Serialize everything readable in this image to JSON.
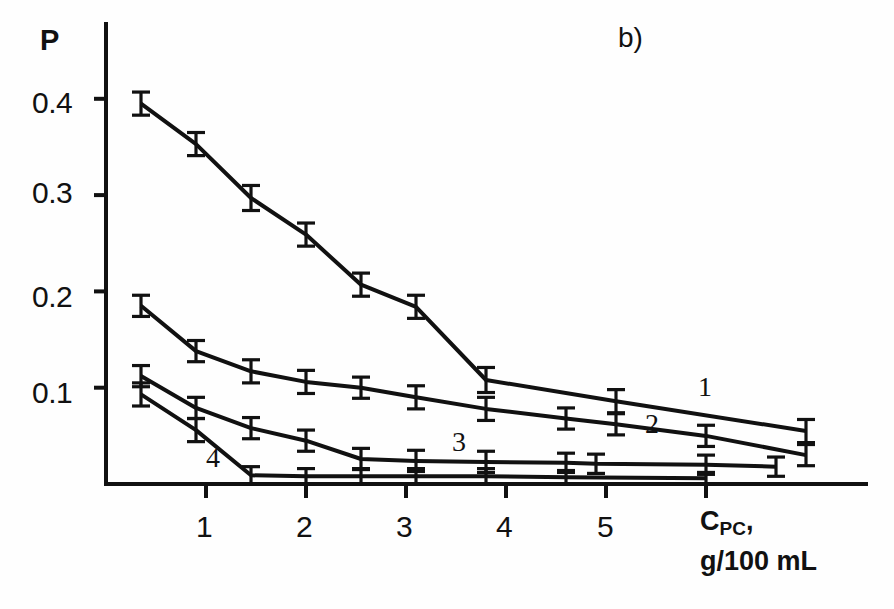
{
  "figure": {
    "panel_label": "b)",
    "background_color": "#fefefe",
    "ink_color": "#111111"
  },
  "axes": {
    "y_title": "P",
    "x_title_main": "C",
    "x_title_sub": "PC",
    "x_title_comma": ",",
    "x_units": "g/100 mL",
    "y_ticks": [
      "0.1",
      "0.2",
      "0.3",
      "0.4"
    ],
    "x_ticks": [
      "1",
      "2",
      "3",
      "4",
      "5"
    ]
  },
  "curve_labels": {
    "one": "1",
    "two": "2",
    "three": "3",
    "four": "4"
  },
  "chart_data": {
    "type": "line",
    "title": "b)",
    "xlabel": "C_PC, g/100 mL",
    "ylabel": "P",
    "xlim": [
      0,
      7.6
    ],
    "ylim": [
      0,
      0.47
    ],
    "grid": false,
    "legend": "inline curve numbers 1-4",
    "error_bars": "symmetric vertical I-bars on every point",
    "series": [
      {
        "name": "1",
        "label_position": {
          "x": 6.1,
          "y": 0.105
        },
        "x": [
          0.35,
          0.9,
          1.45,
          2.0,
          2.55,
          3.1,
          3.8,
          5.1,
          7.0
        ],
        "y": [
          0.395,
          0.353,
          0.297,
          0.259,
          0.207,
          0.184,
          0.108,
          0.086,
          0.055
        ],
        "yerr": [
          0.012,
          0.012,
          0.013,
          0.012,
          0.012,
          0.012,
          0.013,
          0.012,
          0.012
        ]
      },
      {
        "name": "2",
        "label_position": {
          "x": 5.45,
          "y": 0.073
        },
        "x": [
          0.35,
          0.9,
          1.45,
          2.0,
          2.55,
          3.1,
          3.8,
          4.6,
          5.1,
          6.0,
          7.0
        ],
        "y": [
          0.185,
          0.138,
          0.117,
          0.106,
          0.1,
          0.09,
          0.078,
          0.068,
          0.062,
          0.05,
          0.03
        ],
        "yerr": [
          0.011,
          0.011,
          0.012,
          0.012,
          0.011,
          0.012,
          0.012,
          0.011,
          0.011,
          0.011,
          0.011
        ]
      },
      {
        "name": "3",
        "label_position": {
          "x": 3.55,
          "y": 0.042
        },
        "x": [
          0.35,
          0.9,
          1.45,
          2.0,
          2.55,
          3.1,
          3.8,
          4.6,
          4.9,
          6.0,
          6.7
        ],
        "y": [
          0.112,
          0.079,
          0.058,
          0.045,
          0.026,
          0.024,
          0.023,
          0.022,
          0.021,
          0.02,
          0.018
        ],
        "yerr": [
          0.011,
          0.011,
          0.011,
          0.011,
          0.011,
          0.011,
          0.011,
          0.01,
          0.01,
          0.01,
          0.01
        ]
      },
      {
        "name": "4",
        "label_position": {
          "x": 1.12,
          "y": 0.025
        },
        "x": [
          0.35,
          0.9,
          1.45,
          2.0,
          2.55,
          3.1,
          3.8,
          4.6,
          6.0
        ],
        "y": [
          0.093,
          0.056,
          0.009,
          0.008,
          0.008,
          0.008,
          0.008,
          0.007,
          0.006
        ],
        "yerr": [
          0.012,
          0.012,
          0.009,
          0.008,
          0.008,
          0.008,
          0.008,
          0.007,
          0.006
        ]
      }
    ]
  }
}
